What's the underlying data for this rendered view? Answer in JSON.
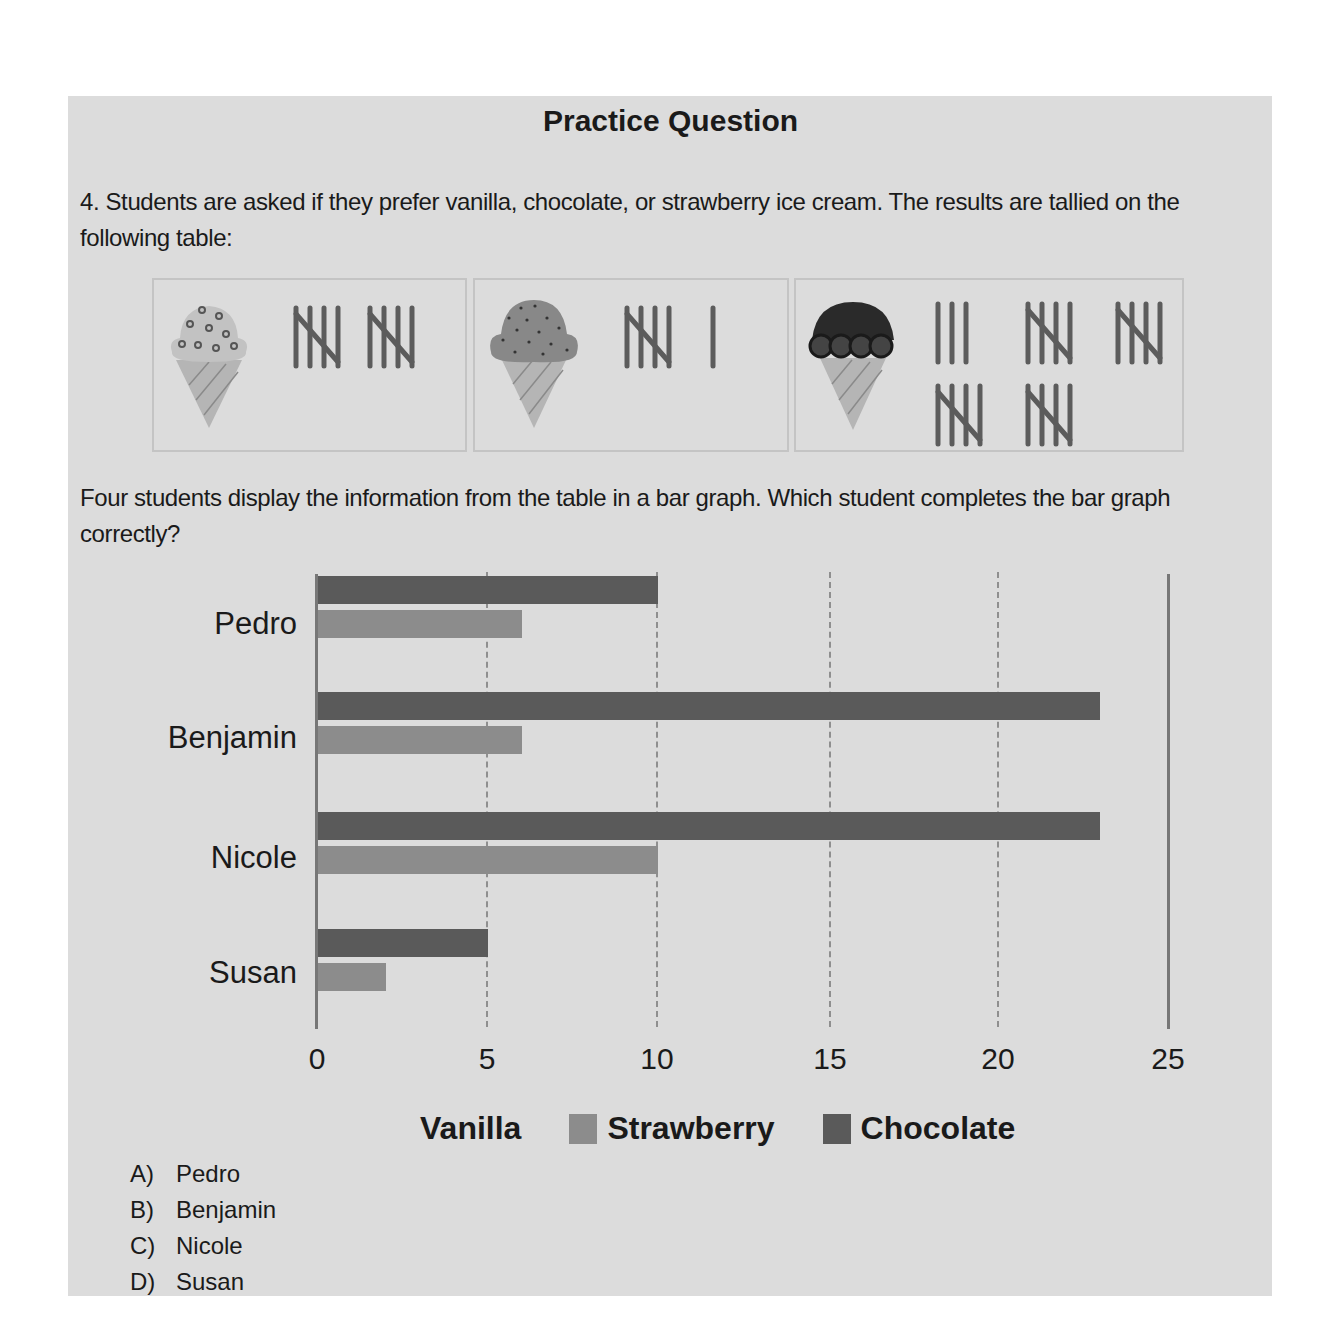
{
  "title": "Practice Question",
  "question": {
    "number": "4.",
    "text": "Students are asked if they prefer vanilla, chocolate, or strawberry ice cream. The results are tallied on the following table:",
    "text2": "Four students display the information from the table in a bar graph. Which student completes the bar graph correctly?"
  },
  "tally_table": [
    {
      "flavor": "Vanilla",
      "icon": "vanilla-ice-cream-cone-icon",
      "tally": "𝍸 𝍸",
      "count": 10
    },
    {
      "flavor": "Strawberry",
      "icon": "strawberry-ice-cream-cone-icon",
      "tally": "𝍸 |",
      "count": 6
    },
    {
      "flavor": "Chocolate",
      "icon": "chocolate-ice-cream-cone-icon",
      "tally": "||| 𝍸 𝍸 𝍸 𝍸",
      "count": 23
    }
  ],
  "colors": {
    "page_bg": "#dcdcdc",
    "chocolate": "#5a5a5a",
    "strawberry": "#8c8c8c",
    "axis": "#777777",
    "tally": "#5c5c5c"
  },
  "chart_data": {
    "type": "bar",
    "orientation": "horizontal",
    "categories": [
      "Pedro",
      "Benjamin",
      "Nicole",
      "Susan"
    ],
    "series": [
      {
        "name": "Vanilla",
        "values": [
          0,
          0,
          0,
          0
        ]
      },
      {
        "name": "Strawberry",
        "values": [
          6,
          6,
          10,
          2
        ]
      },
      {
        "name": "Chocolate",
        "values": [
          10,
          23,
          23,
          5
        ]
      }
    ],
    "title": "",
    "xlabel": "",
    "ylabel": "",
    "xlim": [
      0,
      25
    ],
    "x_ticks": [
      "0",
      "5",
      "10",
      "15",
      "20",
      "25"
    ],
    "grid": "dashed vertical at 5, 10, 15, 20",
    "legend": [
      "Vanilla",
      "Strawberry",
      "Chocolate"
    ],
    "legend_position": "bottom"
  },
  "answer_choices": [
    {
      "letter": "A)",
      "text": "Pedro"
    },
    {
      "letter": "B)",
      "text": "Benjamin"
    },
    {
      "letter": "C)",
      "text": "Nicole"
    },
    {
      "letter": "D)",
      "text": "Susan"
    }
  ]
}
